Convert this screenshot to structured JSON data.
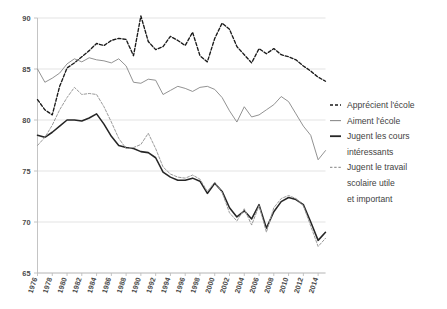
{
  "chart_data": {
    "type": "line",
    "title": "",
    "subtitle": "",
    "xlabel": "",
    "ylabel": "",
    "xlim": [
      1976,
      2015
    ],
    "ylim": [
      65,
      90
    ],
    "yticks": [
      65,
      70,
      75,
      80,
      85,
      90
    ],
    "ytick_labels": [
      "65",
      "70",
      "75",
      "80",
      "85",
      "90"
    ],
    "xticks": [
      1976,
      1978,
      1980,
      1982,
      1984,
      1986,
      1988,
      1990,
      1992,
      1994,
      1996,
      1998,
      2000,
      2002,
      2004,
      2006,
      2008,
      2010,
      2012,
      2014
    ],
    "xtick_labels": [
      "1976",
      "1978",
      "1980",
      "1982",
      "1984",
      "1986",
      "1988",
      "1990",
      "1992",
      "1994",
      "1996",
      "1998",
      "2000",
      "2002",
      "2004",
      "2006",
      "2008",
      "2010",
      "2012",
      "2014"
    ],
    "grid": true,
    "legend_position": "right",
    "x": [
      1976,
      1977,
      1978,
      1979,
      1980,
      1981,
      1982,
      1983,
      1984,
      1985,
      1986,
      1987,
      1988,
      1989,
      1990,
      1991,
      1992,
      1993,
      1994,
      1995,
      1996,
      1997,
      1998,
      1999,
      2000,
      2001,
      2002,
      2003,
      2004,
      2005,
      2006,
      2007,
      2008,
      2009,
      2010,
      2011,
      2012,
      2013,
      2014,
      2015
    ],
    "series": [
      {
        "name": "Apprécient l'école",
        "style": "dashed",
        "color": "#1a1a1a",
        "values": [
          82.0,
          81.0,
          80.5,
          83.3,
          85.1,
          85.6,
          86.2,
          86.8,
          87.5,
          87.3,
          87.8,
          88.0,
          87.9,
          86.3,
          90.2,
          87.7,
          86.9,
          87.2,
          88.2,
          87.8,
          87.3,
          88.6,
          86.3,
          85.7,
          88.0,
          89.5,
          88.9,
          87.2,
          86.4,
          85.6,
          87.0,
          86.5,
          87.0,
          86.4,
          86.2,
          85.9,
          85.3,
          84.8,
          84.2,
          83.8
        ]
      },
      {
        "name": "Aiment l'école",
        "style": "solid",
        "color": "#8c8c8c",
        "values": [
          85.0,
          83.7,
          84.1,
          84.6,
          85.5,
          86.0,
          85.7,
          86.1,
          85.9,
          85.8,
          85.6,
          86.0,
          85.3,
          83.7,
          83.6,
          84.0,
          83.9,
          82.5,
          82.9,
          83.3,
          83.1,
          82.8,
          83.2,
          83.3,
          83.0,
          82.2,
          80.9,
          79.8,
          81.3,
          80.3,
          80.5,
          81.0,
          81.5,
          82.3,
          81.8,
          80.6,
          79.4,
          78.5,
          76.1,
          77.0
        ]
      },
      {
        "name": "Jugent les cours intéressants",
        "style": "solid-bold",
        "color": "#262626",
        "values": [
          78.5,
          78.3,
          78.8,
          79.4,
          80.0,
          80.0,
          79.9,
          80.2,
          80.6,
          79.6,
          78.4,
          77.5,
          77.3,
          77.2,
          76.9,
          76.8,
          76.3,
          74.9,
          74.4,
          74.1,
          74.1,
          74.3,
          74.0,
          72.8,
          73.8,
          73.0,
          71.4,
          70.5,
          71.1,
          70.3,
          71.7,
          69.4,
          71.0,
          72.0,
          72.4,
          72.2,
          71.7,
          70.0,
          68.2,
          69.0
        ]
      },
      {
        "name": "Jugent le travail scolaire utile et important",
        "style": "dashed-gray",
        "color": "#9a9a9a",
        "values": [
          77.5,
          78.3,
          79.5,
          81.0,
          82.2,
          83.2,
          82.5,
          82.6,
          82.5,
          81.3,
          79.8,
          78.2,
          77.2,
          77.3,
          77.6,
          78.7,
          77.2,
          75.4,
          74.7,
          74.4,
          74.3,
          74.6,
          74.2,
          73.0,
          73.9,
          72.9,
          70.9,
          70.1,
          71.3,
          69.7,
          71.6,
          69.0,
          71.4,
          72.3,
          72.6,
          72.3,
          71.6,
          69.6,
          67.6,
          68.4
        ]
      }
    ]
  },
  "legend": {
    "items": [
      {
        "label": "Apprécient l'école",
        "marker": "dashed-dark"
      },
      {
        "label": "Aiment l'école",
        "marker": "solid-gray"
      },
      {
        "label": "Jugent les cours",
        "marker": "solid-dark"
      },
      {
        "label": "intéressants",
        "marker": "none"
      },
      {
        "label": "Jugent le travail",
        "marker": "dashed-gray"
      },
      {
        "label": "scolaire utile",
        "marker": "none"
      },
      {
        "label": "et important",
        "marker": "none"
      }
    ]
  },
  "colors": {
    "grid": "#dcdcdc",
    "axis": "#bdbdbd",
    "text": "#4a4a4a",
    "series_dark": "#1a1a1a",
    "series_gray": "#8c8c8c",
    "series_black": "#262626",
    "series_gray_dashed": "#9a9a9a",
    "background": "#ffffff"
  }
}
